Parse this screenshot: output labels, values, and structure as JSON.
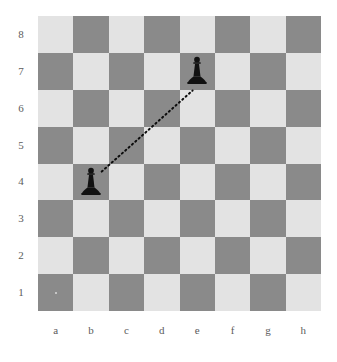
{
  "diagram": {
    "type": "chessboard",
    "title": "",
    "board_size": 8,
    "orientation": "white-bottom",
    "colors": {
      "light_square": "#e3e3e3",
      "dark_square": "#8a8a8a",
      "piece_black": "#111111",
      "label_text": "#5c5c5c",
      "move_line": "#0d0d0d",
      "background": "#ffffff"
    },
    "files": [
      "a",
      "b",
      "c",
      "d",
      "e",
      "f",
      "g",
      "h"
    ],
    "ranks": [
      "8",
      "7",
      "6",
      "5",
      "4",
      "3",
      "2",
      "1"
    ],
    "square_colors": [
      [
        "light",
        "dark",
        "light",
        "dark",
        "light",
        "dark",
        "light",
        "dark"
      ],
      [
        "dark",
        "light",
        "dark",
        "light",
        "dark",
        "light",
        "dark",
        "light"
      ],
      [
        "light",
        "dark",
        "light",
        "dark",
        "light",
        "dark",
        "light",
        "dark"
      ],
      [
        "dark",
        "light",
        "dark",
        "light",
        "dark",
        "light",
        "dark",
        "light"
      ],
      [
        "light",
        "dark",
        "light",
        "dark",
        "light",
        "dark",
        "light",
        "dark"
      ],
      [
        "dark",
        "light",
        "dark",
        "light",
        "dark",
        "light",
        "dark",
        "light"
      ],
      [
        "light",
        "dark",
        "light",
        "dark",
        "light",
        "dark",
        "light",
        "dark"
      ],
      [
        "dark",
        "light",
        "dark",
        "light",
        "dark",
        "light",
        "dark",
        "light"
      ]
    ],
    "pieces": [
      {
        "id": "piece-e7",
        "square": "e7",
        "file": "e",
        "rank": "7",
        "type": "pawn",
        "color": "black",
        "glyph": "pawn-black-icon"
      },
      {
        "id": "piece-b4",
        "square": "b4",
        "file": "b",
        "rank": "4",
        "type": "pawn",
        "color": "black",
        "glyph": "pawn-black-icon"
      }
    ],
    "move_arrows": [
      {
        "id": "move-b4-e7",
        "from": "b4",
        "to": "e7",
        "style": "dotted",
        "label": "b4-e7"
      }
    ],
    "markers": [
      {
        "id": "marker-a1",
        "square": "a1",
        "kind": "dot",
        "color": "#d8d8d8"
      }
    ]
  },
  "chart_data": {
    "type": "table",
    "xlabel": "files",
    "ylabel": "ranks",
    "categories": [
      "a",
      "b",
      "c",
      "d",
      "e",
      "f",
      "g",
      "h"
    ],
    "rows": [
      "8",
      "7",
      "6",
      "5",
      "4",
      "3",
      "2",
      "1"
    ],
    "values": [
      [
        "",
        "",
        "",
        "",
        "",
        "",
        "",
        ""
      ],
      [
        "",
        "",
        "",
        "",
        "black pawn",
        "",
        "",
        ""
      ],
      [
        "",
        "",
        "",
        "",
        "",
        "",
        "",
        ""
      ],
      [
        "",
        "",
        "",
        "",
        "",
        "",
        "",
        ""
      ],
      [
        "",
        "black pawn",
        "",
        "",
        "",
        "",
        "",
        ""
      ],
      [
        "",
        "",
        "",
        "",
        "",
        "",
        "",
        ""
      ],
      [
        "",
        "",
        "",
        "",
        "",
        "",
        "",
        ""
      ],
      [
        "",
        "",
        "",
        "",
        "",
        "",
        "",
        ""
      ]
    ],
    "annotations": [
      {
        "text": "dotted line from b4 to e7",
        "from": "b4",
        "to": "e7"
      }
    ],
    "legend": [],
    "grid": true
  }
}
